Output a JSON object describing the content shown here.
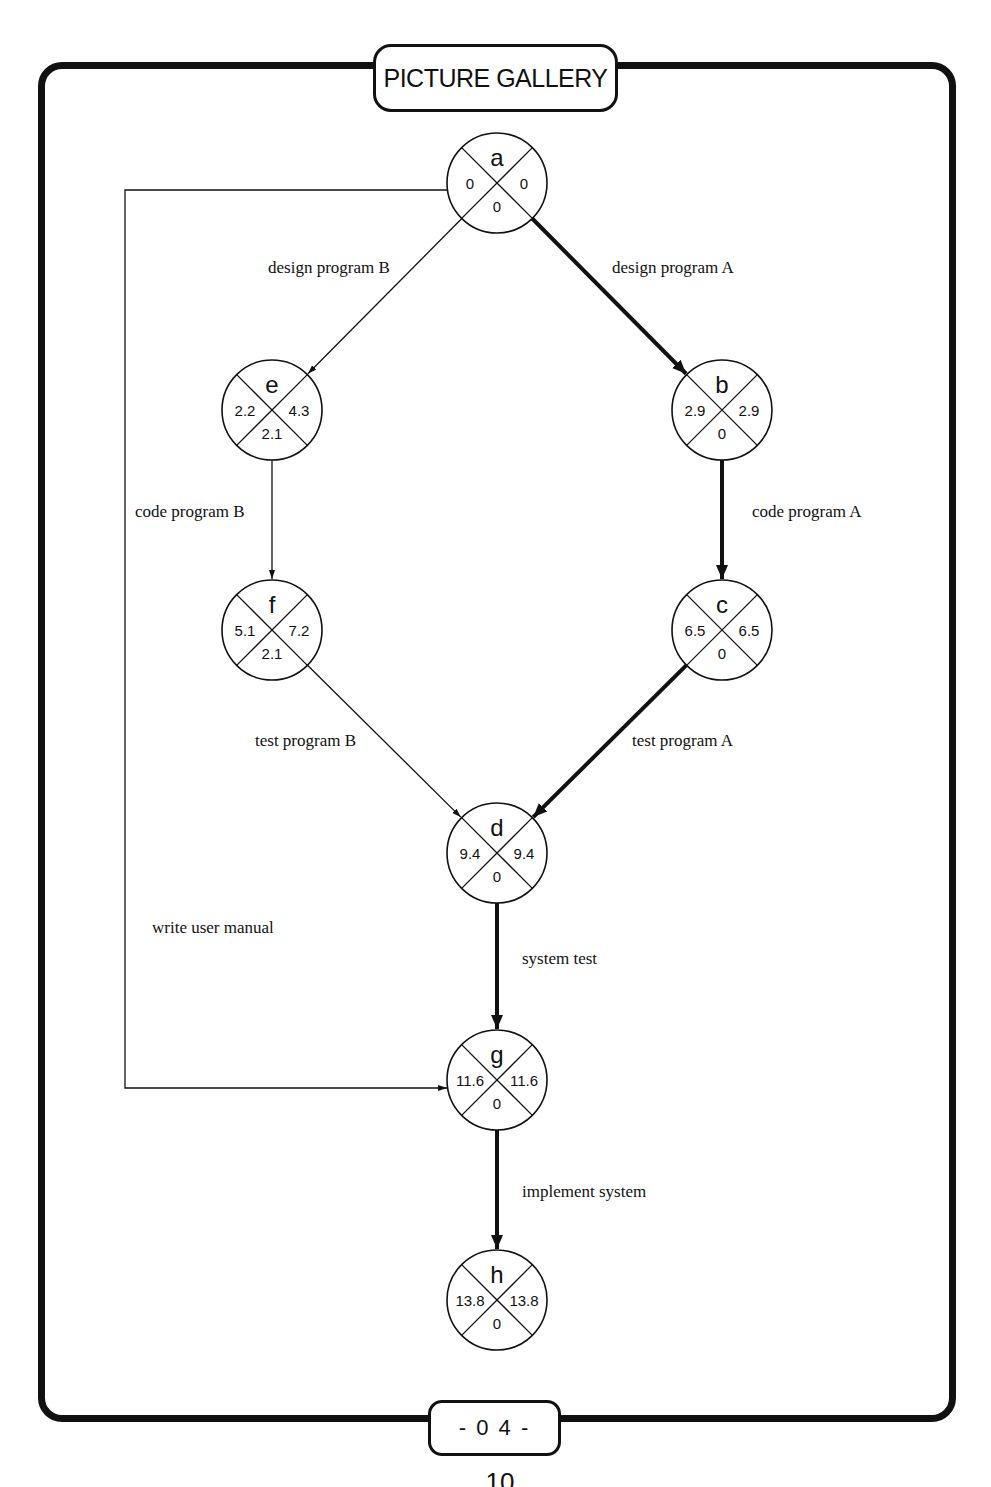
{
  "header": {
    "title": "PICTURE GALLERY"
  },
  "footer": {
    "page_label": "- 0 4 -",
    "page_number_partial": "10"
  },
  "colors": {
    "ink": "#111111",
    "background": "#ffffff"
  },
  "diagram": {
    "type": "activity-on-arrow network (critical path)",
    "node_radius": 50,
    "nodes": [
      {
        "id": "a",
        "x": 497,
        "y": 183,
        "earliest": "0",
        "latest": "0",
        "slack": "0"
      },
      {
        "id": "e",
        "x": 272,
        "y": 410,
        "earliest": "2.2",
        "latest": "4.3",
        "slack": "2.1"
      },
      {
        "id": "b",
        "x": 722,
        "y": 410,
        "earliest": "2.9",
        "latest": "2.9",
        "slack": "0"
      },
      {
        "id": "f",
        "x": 272,
        "y": 630,
        "earliest": "5.1",
        "latest": "7.2",
        "slack": "2.1"
      },
      {
        "id": "c",
        "x": 722,
        "y": 630,
        "earliest": "6.5",
        "latest": "6.5",
        "slack": "0"
      },
      {
        "id": "d",
        "x": 497,
        "y": 853,
        "earliest": "9.4",
        "latest": "9.4",
        "slack": "0"
      },
      {
        "id": "g",
        "x": 497,
        "y": 1080,
        "earliest": "11.6",
        "latest": "11.6",
        "slack": "0"
      },
      {
        "id": "h",
        "x": 497,
        "y": 1300,
        "earliest": "13.8",
        "latest": "13.8",
        "slack": "0"
      }
    ],
    "edges": [
      {
        "from": "a",
        "to": "e",
        "label": "design program B",
        "critical": false,
        "label_x": 268,
        "label_y": 273
      },
      {
        "from": "a",
        "to": "b",
        "label": "design program A",
        "critical": true,
        "label_x": 612,
        "label_y": 273
      },
      {
        "from": "e",
        "to": "f",
        "label": "code program B",
        "critical": false,
        "label_x": 135,
        "label_y": 517
      },
      {
        "from": "b",
        "to": "c",
        "label": "code program A",
        "critical": true,
        "label_x": 752,
        "label_y": 517
      },
      {
        "from": "f",
        "to": "d",
        "label": "test program B",
        "critical": false,
        "label_x": 255,
        "label_y": 746
      },
      {
        "from": "c",
        "to": "d",
        "label": "test program A",
        "critical": true,
        "label_x": 632,
        "label_y": 746
      },
      {
        "from": "d",
        "to": "g",
        "label": "system test",
        "critical": true,
        "label_x": 522,
        "label_y": 964
      },
      {
        "from": "g",
        "to": "h",
        "label": "implement system",
        "critical": true,
        "label_x": 522,
        "label_y": 1197
      },
      {
        "from": "a",
        "to": "g",
        "label": "write user manual",
        "critical": false,
        "label_x": 152,
        "label_y": 933,
        "route": [
          [
            447,
            190
          ],
          [
            125,
            190
          ],
          [
            125,
            1088
          ],
          [
            447,
            1088
          ]
        ]
      }
    ]
  }
}
